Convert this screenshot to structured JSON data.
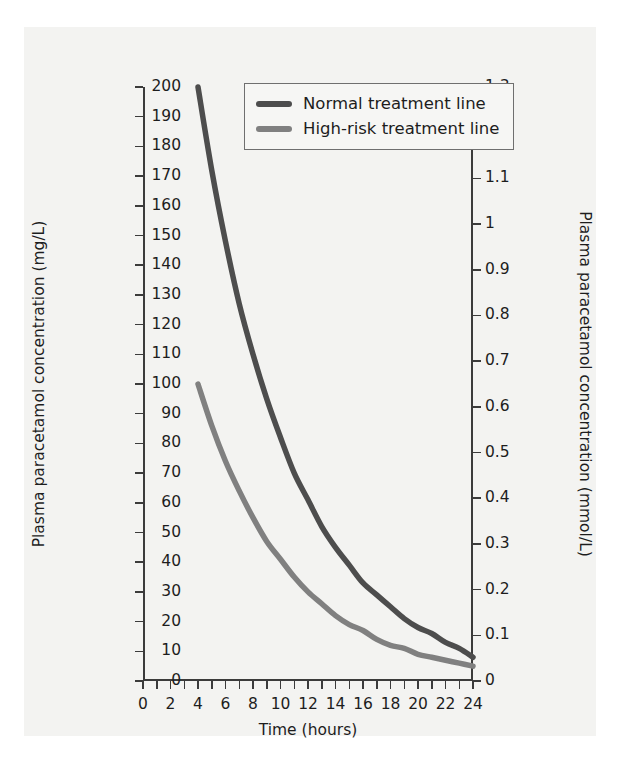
{
  "chart_data": {
    "type": "line",
    "title": "",
    "xlabel": "Time (hours)",
    "ylabel": "Plasma paracetamol concentration (mg/L)",
    "ylabel_right": "Plasma paracetamol concentration (mmol/L)",
    "xlim": [
      0,
      24
    ],
    "ylim": [
      0,
      200
    ],
    "ylim_right": [
      0,
      1.3
    ],
    "grid": false,
    "legend_position": "top-center",
    "x_ticks_major": [
      0,
      2,
      4,
      6,
      8,
      10,
      12,
      14,
      16,
      18,
      20,
      22,
      24
    ],
    "x_tick_labels": [
      "0",
      "2",
      "4",
      "6",
      "8",
      "10",
      "12",
      "14",
      "16",
      "18",
      "20",
      "22",
      "24"
    ],
    "x_tick_step_minor": 1,
    "y_ticks_left": [
      0,
      10,
      20,
      30,
      40,
      50,
      60,
      70,
      80,
      90,
      100,
      110,
      120,
      130,
      140,
      150,
      160,
      170,
      180,
      190,
      200
    ],
    "y_tick_labels_left": [
      "0",
      "10",
      "20",
      "30",
      "40",
      "50",
      "60",
      "70",
      "80",
      "90",
      "100",
      "110",
      "120",
      "130",
      "140",
      "150",
      "160",
      "170",
      "180",
      "190",
      "200"
    ],
    "y_ticks_right": [
      0,
      0.1,
      0.2,
      0.3,
      0.4,
      0.5,
      0.6,
      0.7,
      0.8,
      0.9,
      1,
      1.1,
      1.2,
      1.3
    ],
    "y_tick_labels_right": [
      "0",
      "0.1",
      "0.2",
      "0.3",
      "0.4",
      "0.5",
      "0.6",
      "0.7",
      "0.8",
      "0.9",
      "1",
      "1.1",
      "1.2",
      "1.3"
    ],
    "series": [
      {
        "name": "Normal treatment line",
        "color": "#4d4d4d",
        "x": [
          4,
          5,
          6,
          7,
          8,
          9,
          10,
          11,
          12,
          13,
          14,
          15,
          16,
          17,
          18,
          19,
          20,
          21,
          22,
          23,
          24
        ],
        "values": [
          200,
          172,
          148,
          127,
          110,
          95,
          82,
          70,
          61,
          52,
          45,
          39,
          33,
          29,
          25,
          21,
          18,
          16,
          13,
          11,
          8
        ]
      },
      {
        "name": "High-risk treatment line",
        "color": "#808080",
        "x": [
          4,
          5,
          6,
          7,
          8,
          9,
          10,
          11,
          12,
          13,
          14,
          15,
          16,
          17,
          18,
          19,
          20,
          21,
          22,
          23,
          24
        ],
        "values": [
          100,
          86,
          74,
          64,
          55,
          47,
          41,
          35,
          30,
          26,
          22,
          19,
          17,
          14,
          12,
          11,
          9,
          8,
          7,
          6,
          5
        ]
      }
    ]
  },
  "legend": {
    "items": [
      {
        "label": "Normal treatment line",
        "color": "#4d4d4d"
      },
      {
        "label": "High-risk treatment line",
        "color": "#808080"
      }
    ]
  },
  "axes": {
    "x_title": "Time (hours)",
    "y_title_left": "Plasma paracetamol concentration (mg/L)",
    "y_title_right": "Plasma paracetamol concentration (mmol/L)"
  },
  "colors": {
    "normal_line": "#4d4d4d",
    "high_risk_line": "#808080",
    "axis": "#3b3b3b",
    "panel_background": "#f3f3f1",
    "text": "#1d1d1d"
  }
}
